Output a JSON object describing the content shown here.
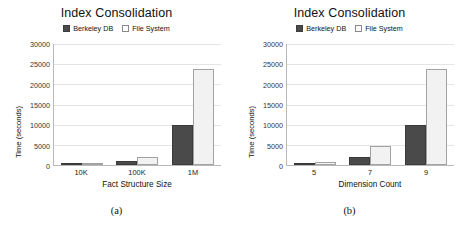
{
  "figure": {
    "legend": {
      "entries": [
        {
          "label": "Berkeley DB",
          "color": "#4a4a4a",
          "swatch": "dark"
        },
        {
          "label": "File System",
          "color": "#f2f2f2",
          "swatch": "light"
        }
      ]
    },
    "panels": [
      {
        "caption": "(a)"
      },
      {
        "caption": "(b)"
      }
    ]
  },
  "chart_data": [
    {
      "type": "bar",
      "title": "Index Consolidation",
      "xlabel": "Fact Structure Size",
      "ylabel": "Time (seconds)",
      "categories": [
        "10K",
        "100K",
        "1M"
      ],
      "series": [
        {
          "name": "Berkeley DB",
          "values": [
            60,
            950,
            10000
          ],
          "color": "#4a4a4a"
        },
        {
          "name": "File System",
          "values": [
            90,
            2000,
            23700
          ],
          "color": "#f2f2f2"
        }
      ],
      "ylim": [
        0,
        30000
      ],
      "yticks": [
        0,
        5000,
        10000,
        15000,
        20000,
        25000,
        30000
      ],
      "grid": true,
      "legend_position": "top-center",
      "caption": "(a)"
    },
    {
      "type": "bar",
      "title": "Index Consolidation",
      "xlabel": "Dimension Count",
      "ylabel": "Time (seconds)",
      "categories": [
        "5",
        "7",
        "9"
      ],
      "series": [
        {
          "name": "Berkeley DB",
          "values": [
            350,
            2000,
            10000
          ],
          "color": "#4a4a4a"
        },
        {
          "name": "File System",
          "values": [
            700,
            4700,
            23700
          ],
          "color": "#f2f2f2"
        }
      ],
      "ylim": [
        0,
        30000
      ],
      "yticks": [
        0,
        5000,
        10000,
        15000,
        20000,
        25000,
        30000
      ],
      "grid": true,
      "legend_position": "top-center",
      "caption": "(b)"
    }
  ]
}
